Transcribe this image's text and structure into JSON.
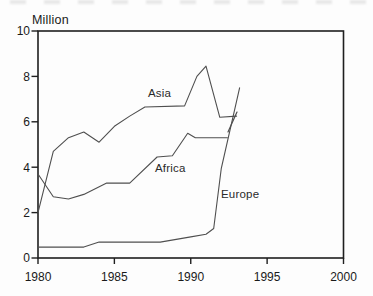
{
  "chart_data": {
    "type": "line",
    "title": "",
    "y_axis_title": "Million",
    "xlabel": "",
    "ylabel": "Million",
    "x_range": [
      1980,
      2000
    ],
    "y_range": [
      0,
      10
    ],
    "x_ticks": [
      "1980",
      "1985",
      "1990",
      "1995",
      "2000"
    ],
    "x_tick_values": [
      1980,
      1985,
      1990,
      1995,
      2000
    ],
    "y_ticks": [
      "0",
      "2",
      "4",
      "6",
      "8",
      "10"
    ],
    "y_tick_values": [
      0,
      2,
      4,
      6,
      8,
      10
    ],
    "grid": false,
    "legend": "inline-labels-next-to-lines",
    "series": [
      {
        "name": "Asia",
        "points": [
          [
            1980,
            2.0
          ],
          [
            1981,
            4.7
          ],
          [
            1982,
            5.3
          ],
          [
            1983,
            5.55
          ],
          [
            1984,
            5.1
          ],
          [
            1985,
            5.8
          ],
          [
            1986,
            6.25
          ],
          [
            1987,
            6.65
          ],
          [
            1989.6,
            6.7
          ],
          [
            1990.4,
            8.0
          ],
          [
            1991,
            8.45
          ],
          [
            1991.9,
            6.2
          ],
          [
            1993,
            6.25
          ]
        ]
      },
      {
        "name": "Africa",
        "points": [
          [
            1980,
            3.7
          ],
          [
            1981,
            2.7
          ],
          [
            1982,
            2.6
          ],
          [
            1983,
            2.8
          ],
          [
            1984.5,
            3.3
          ],
          [
            1986,
            3.3
          ],
          [
            1987.8,
            4.45
          ],
          [
            1988.8,
            4.5
          ],
          [
            1989.8,
            5.5
          ],
          [
            1990.3,
            5.3
          ],
          [
            1992.4,
            5.3
          ]
        ]
      },
      {
        "name": "Europe",
        "points": [
          [
            1980,
            0.48
          ],
          [
            1983,
            0.48
          ],
          [
            1984,
            0.7
          ],
          [
            1988,
            0.7
          ],
          [
            1990,
            0.93
          ],
          [
            1991,
            1.05
          ],
          [
            1991.5,
            1.3
          ],
          [
            1992,
            3.95
          ],
          [
            1993.2,
            7.5
          ]
        ]
      }
    ],
    "annotations": {
      "break_mark_px": {
        "x1": 228,
        "y1": 132,
        "x2": 237,
        "y2": 112
      }
    },
    "colors": {
      "line": "#4f4f4f",
      "axis": "#1f1f1f",
      "text": "#1a1a1a",
      "background": "#fdfdfd"
    }
  }
}
